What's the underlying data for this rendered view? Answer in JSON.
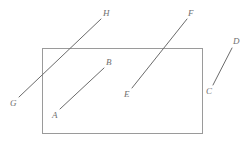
{
  "figure": {
    "type": "geometry-diagram",
    "caption": "",
    "canvas": {
      "width": 249,
      "height": 145,
      "background": "#ffffff"
    },
    "style": {
      "rectangle_stroke": "#9a9a9a",
      "segment_stroke": "#6b6b6b",
      "label_color": "#6f6f6f",
      "stroke_width": 1
    },
    "rectangle": {
      "name": "bounding-rectangle",
      "x": 42,
      "y": 48,
      "width": 161,
      "height": 86
    },
    "segments": [
      {
        "id": "AB",
        "start_label": "A",
        "end_label": "B",
        "x1": 60,
        "y1": 109,
        "x2": 104,
        "y2": 68,
        "start_label_x": 52,
        "start_label_y": 111,
        "end_label_x": 106,
        "end_label_y": 58
      },
      {
        "id": "CD",
        "start_label": "C",
        "end_label": "D",
        "x1": 213,
        "y1": 85,
        "x2": 232,
        "y2": 48,
        "start_label_x": 206,
        "start_label_y": 87,
        "end_label_x": 233,
        "end_label_y": 37
      },
      {
        "id": "EF",
        "start_label": "E",
        "end_label": "F",
        "x1": 132,
        "y1": 88,
        "x2": 187,
        "y2": 19,
        "start_label_x": 124,
        "start_label_y": 90,
        "end_label_x": 188,
        "end_label_y": 9
      },
      {
        "id": "GH",
        "start_label": "G",
        "end_label": "H",
        "x1": 19,
        "y1": 97,
        "x2": 101,
        "y2": 19,
        "start_label_x": 10,
        "start_label_y": 99,
        "end_label_x": 103,
        "end_label_y": 9
      }
    ],
    "labels": [
      {
        "text": "A",
        "name": "point-label-a",
        "x": 52,
        "y": 111
      },
      {
        "text": "B",
        "name": "point-label-b",
        "x": 106,
        "y": 58
      },
      {
        "text": "C",
        "name": "point-label-c",
        "x": 206,
        "y": 87
      },
      {
        "text": "D",
        "name": "point-label-d",
        "x": 233,
        "y": 37
      },
      {
        "text": "E",
        "name": "point-label-e",
        "x": 124,
        "y": 90
      },
      {
        "text": "F",
        "name": "point-label-f",
        "x": 188,
        "y": 9
      },
      {
        "text": "G",
        "name": "point-label-g",
        "x": 10,
        "y": 99
      },
      {
        "text": "H",
        "name": "point-label-h",
        "x": 103,
        "y": 9
      }
    ]
  }
}
